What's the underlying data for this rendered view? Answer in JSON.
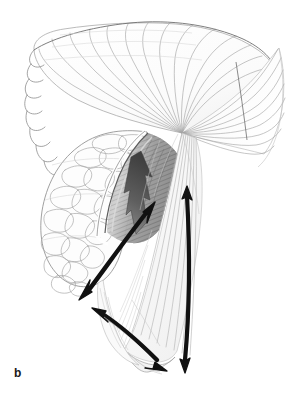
{
  "figure": {
    "panel_label": "b",
    "caption_text": "",
    "medium": "grayscale anatomical line illustration",
    "background_color": "#ffffff",
    "ink_color": "#1a1a1a",
    "width_px": 299,
    "height_px": 394
  },
  "palette": {
    "background": "#ffffff",
    "line_light": "#b9b9b9",
    "line_mid": "#8a8a8a",
    "line_dark": "#4a4a4a",
    "ink_black": "#111111",
    "shade_light": "#dcdcdc",
    "shade_mid": "#9b9b9b",
    "shade_dark": "#5c5c5c",
    "gray_arrow_fill": "#4e4e4e",
    "gray_arrow_fill_light": "#8e8e8e"
  },
  "structures": [
    {
      "id": "fan-muscle",
      "name": "fan-shaped muscle with radiating fibers",
      "region": "upper-left to center",
      "fiber_count": 14,
      "convergence_point": [
        182,
        133
      ]
    },
    {
      "id": "lobulated-mass",
      "name": "lobulated scale-textured mass",
      "region": "left-center",
      "lobule_rows": 9
    },
    {
      "id": "shaded-belly",
      "name": "shaded muscle belly with cut edge",
      "region": "center",
      "shading": "hatched gradient"
    },
    {
      "id": "lower-fascia",
      "name": "lower striated fascial sheet",
      "region": "lower-center"
    },
    {
      "id": "right-tendon-sheet",
      "name": "right tendinous sheet",
      "region": "upper-right"
    }
  ],
  "annotations": {
    "arrows": [
      {
        "id": "gray-zigzag-arrow",
        "name": "thick gray zigzag arrow",
        "style": "solid filled, gray",
        "heads": 1,
        "direction": "upward",
        "from": [
          128,
          232
        ],
        "to": [
          140,
          152
        ],
        "color": "#4e4e4e"
      },
      {
        "id": "diagonal-double-arrow",
        "name": "diagonal double-headed arrow",
        "style": "stroked, black",
        "heads": 2,
        "direction": "up-right / down-left",
        "from": [
          82,
          296
        ],
        "to": [
          154,
          205
        ],
        "color": "#111111"
      },
      {
        "id": "curved-lower-double-arrow",
        "name": "curved lower double-headed arrow",
        "style": "stroked curved, black",
        "heads": 2,
        "direction": "up-left / down-right",
        "from": [
          95,
          313
        ],
        "to": [
          166,
          372
        ],
        "color": "#111111"
      },
      {
        "id": "vertical-double-arrow",
        "name": "long vertical double-headed arrow",
        "style": "stroked slightly curved, black",
        "heads": 2,
        "direction": "up / down",
        "from": [
          185,
          371
        ],
        "to": [
          187,
          187
        ],
        "color": "#111111"
      }
    ],
    "labels": [
      {
        "id": "panel-label-b",
        "text": "b",
        "position": [
          14,
          375
        ]
      }
    ]
  }
}
